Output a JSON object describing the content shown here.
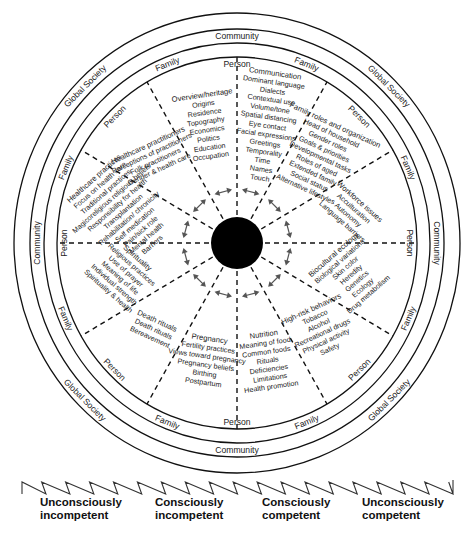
{
  "diagram": {
    "center": {
      "x": 237,
      "y": 243,
      "core_radius": 26,
      "core_color": "#000000"
    },
    "rings": [
      {
        "name": "Global Society",
        "rx": 223,
        "ry": 230
      },
      {
        "name": "Community",
        "rx": 207,
        "ry": 214
      },
      {
        "name": "Family",
        "rx": 193,
        "ry": 200
      },
      {
        "name": "Person",
        "rx": 180,
        "ry": 186
      }
    ],
    "ring_labels": [
      {
        "text": "Community",
        "ring": "community",
        "angle": -90
      },
      {
        "text": "Community",
        "ring": "community",
        "angle": 90
      },
      {
        "text": "Community",
        "ring": "community",
        "angle": 180
      },
      {
        "text": "Community",
        "ring": "community",
        "angle": 0
      },
      {
        "text": "Global Society",
        "ring": "global",
        "angle": -135
      },
      {
        "text": "Global Society",
        "ring": "global",
        "angle": -45
      },
      {
        "text": "Global Society",
        "ring": "global",
        "angle": 135
      },
      {
        "text": "Global Society",
        "ring": "global",
        "angle": 45
      },
      {
        "text": "Family",
        "ring": "family",
        "angle": -112
      },
      {
        "text": "Family",
        "ring": "family",
        "angle": -68
      },
      {
        "text": "Family",
        "ring": "family",
        "angle": -157
      },
      {
        "text": "Family",
        "ring": "family",
        "angle": -23
      },
      {
        "text": "Family",
        "ring": "family",
        "angle": 157
      },
      {
        "text": "Family",
        "ring": "family",
        "angle": 23
      },
      {
        "text": "Family",
        "ring": "family",
        "angle": 112
      },
      {
        "text": "Family",
        "ring": "family",
        "angle": 68
      },
      {
        "text": "Person",
        "ring": "person",
        "angle": -90
      },
      {
        "text": "Person",
        "ring": "person",
        "angle": 90
      },
      {
        "text": "Person",
        "ring": "person",
        "angle": 180
      },
      {
        "text": "Person",
        "ring": "person",
        "angle": 0
      },
      {
        "text": "Person",
        "ring": "person",
        "angle": -135
      },
      {
        "text": "Person",
        "ring": "person",
        "angle": -45
      },
      {
        "text": "Person",
        "ring": "person",
        "angle": 135
      },
      {
        "text": "Person",
        "ring": "person",
        "angle": 45
      }
    ],
    "domains": [
      {
        "id": "overview",
        "title": "Overview/heritage",
        "items": [
          "Origins",
          "Residence",
          "Topography",
          "Economics",
          "Politics",
          "Education",
          "Occupation"
        ]
      },
      {
        "id": "communication",
        "title": "Communication",
        "items": [
          "Dominant language",
          "Dialects",
          "Contextual use",
          "Volume/tone",
          "Spatial distancing",
          "Eye contact",
          "Facial expressions",
          "Greetings",
          "Temporality",
          "Time",
          "Names",
          "Touch"
        ]
      },
      {
        "id": "family",
        "title": "Family roles and organization",
        "items": [
          "Head of household",
          "Gender roles",
          "Goals & priorities",
          "Developmental tasks",
          "Roles of aged",
          "Extended family",
          "Social status",
          "Alternative lifestyles"
        ]
      },
      {
        "id": "workforce",
        "title": "Workforce issues",
        "items": [
          "Acculturation",
          "Autonomy",
          "Language barriers"
        ]
      },
      {
        "id": "biocultural",
        "title": "Biocultural ecology",
        "items": [
          "Biological variations",
          "Skin color",
          "Heredity",
          "Genetics",
          "Ecology",
          "Drug metabolism"
        ]
      },
      {
        "id": "highrisk",
        "title": "High-risk behaviors",
        "items": [
          "Tobacco",
          "Alcohol",
          "Recreational drugs",
          "Physical activity",
          "Safety"
        ]
      },
      {
        "id": "nutrition",
        "title": "Nutrition",
        "items": [
          "Meaning of food",
          "Common foods",
          "Rituals",
          "Deficiencies",
          "Limitations",
          "Health promotion"
        ]
      },
      {
        "id": "pregnancy",
        "title": "Pregnancy",
        "items": [
          "Fertility practices",
          "Views toward pregnancy",
          "Pregnancy beliefs",
          "Birthing",
          "Postpartum"
        ]
      },
      {
        "id": "death",
        "title": "Death rituals",
        "items": [
          "Death rituals",
          "Bereavement"
        ]
      },
      {
        "id": "spirituality",
        "title": "Spirituality",
        "items": [
          "Religious practices",
          "Use of prayer",
          "Meaning of life",
          "Individual strength",
          "Spirituality & health"
        ]
      },
      {
        "id": "healthcare",
        "title": "Healthcare practices",
        "items": [
          "Focus on health care",
          "Traditional practices",
          "Magicoreligious religious beliefs",
          "Responsibility for health",
          "Transplantation",
          "Rehabilitation/ chronicity",
          "Self medication",
          "Pain/sick role",
          "Mental health",
          "Barriers"
        ]
      },
      {
        "id": "practitioners",
        "title": "Healthcare practitioners",
        "items": [
          "Perceptions of practitioners",
          "Folk practitioners",
          "Gender & health care"
        ]
      }
    ]
  },
  "competence_scale": {
    "stages": [
      {
        "line1": "Unconsciously",
        "line2": "incompetent"
      },
      {
        "line1": "Consciously",
        "line2": "incompetent"
      },
      {
        "line1": "Consciously",
        "line2": "competent"
      },
      {
        "line1": "Unconsciously",
        "line2": "competent"
      }
    ],
    "zigzag_teeth": 18
  }
}
